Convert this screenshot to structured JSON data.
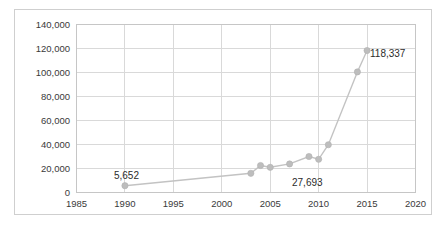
{
  "figure": {
    "frame_color": "#cfcfcf",
    "background": "#ffffff"
  },
  "chart_data": {
    "type": "line",
    "title": "",
    "subtitle": "",
    "xlabel": "",
    "ylabel": "",
    "xlim": [
      1985,
      2020
    ],
    "ylim": [
      0,
      140000
    ],
    "grid": true,
    "legend": false,
    "legend_position": "none",
    "series_color": "#c3c3c3",
    "marker_color": "#bdbdbd",
    "x_ticks": [
      1985,
      1990,
      1995,
      2000,
      2005,
      2010,
      2015,
      2020
    ],
    "x_tick_labels": [
      "1985",
      "1990",
      "1995",
      "2000",
      "2005",
      "2010",
      "2015",
      "2020"
    ],
    "y_ticks": [
      0,
      20000,
      40000,
      60000,
      80000,
      100000,
      120000,
      140000
    ],
    "y_tick_labels": [
      "0",
      "20,000",
      "40,000",
      "60,000",
      "80,000",
      "100,000",
      "120,000",
      "140,000"
    ],
    "x": [
      1990,
      2003,
      2004,
      2005,
      2007,
      2009,
      2010,
      2011,
      2014,
      2015
    ],
    "values": [
      5652,
      16000,
      22500,
      21000,
      23800,
      30000,
      27693,
      39800,
      100500,
      118337
    ],
    "series": [
      {
        "name": "series-1",
        "x": [
          1990,
          2003,
          2004,
          2005,
          2007,
          2009,
          2010,
          2011,
          2014,
          2015
        ],
        "values": [
          5652,
          16000,
          22500,
          21000,
          23800,
          30000,
          27693,
          39800,
          100500,
          118337
        ]
      }
    ],
    "annotations": [
      {
        "text": "5,652",
        "x": 1990,
        "y": 5652,
        "align": "above"
      },
      {
        "text": "27,693",
        "x": 2010,
        "y": 27693,
        "align": "below"
      },
      {
        "text": "118,337",
        "x": 2015,
        "y": 118337,
        "align": "right"
      }
    ]
  }
}
